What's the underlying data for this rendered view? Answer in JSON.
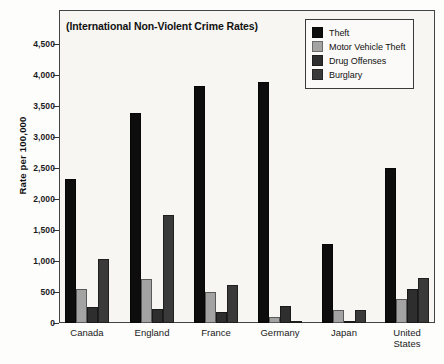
{
  "chart_data": {
    "type": "bar",
    "title": "(International Non-Violent Crime Rates)",
    "xlabel": "",
    "ylabel": "Rate per 100,000",
    "ylim": [
      0,
      4750
    ],
    "grid": false,
    "legend_position": "top-right",
    "categories": [
      "Canada",
      "England",
      "France",
      "Germany",
      "Japan",
      "United\nStates"
    ],
    "yticks": [
      "0",
      "500",
      "1,000",
      "1,500",
      "2,000",
      "2,500",
      "3,000",
      "3,500",
      "4,000",
      "4,500"
    ],
    "ytick_values": [
      0,
      500,
      1000,
      1500,
      2000,
      2500,
      3000,
      3500,
      4000,
      4500
    ],
    "series": [
      {
        "name": "Theft",
        "color": "#0d0d0d",
        "values": [
          2320,
          3380,
          3830,
          3890,
          1270,
          2500
        ]
      },
      {
        "name": "Motor Vehicle Theft",
        "color": "#a3a3a3",
        "values": [
          545,
          715,
          495,
          100,
          205,
          380
        ]
      },
      {
        "name": "Drug Offenses",
        "color": "#2e2e2e",
        "values": [
          255,
          225,
          175,
          280,
          20,
          545
        ]
      },
      {
        "name": "Burglary",
        "color": "#3a3a3a",
        "values": [
          1035,
          1735,
          615,
          10,
          215,
          730
        ]
      }
    ]
  },
  "ghost_text": [
    "that the actual investigation of crimes",
    "distinct",
    "police action",
    "on the uniform standards",
    "to compare with those who can",
    "nothing that over in a country",
    "has led  to  only  brief  sort  of  figures  we  will",
    "uniform crime  and  the  comparison  made  of",
    "the major crimes  are  defined  differently",
    "in very  much  the  same  exercise  in",
    "tions  are  designed  to  count  those  violent"
  ]
}
